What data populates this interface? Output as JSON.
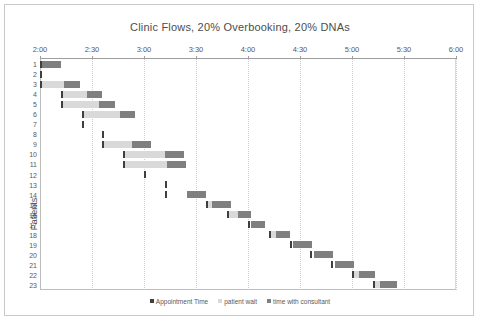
{
  "chart_data": {
    "type": "bar",
    "subtype": "horizontal-stacked-gantt",
    "title": "Clinic Flows, 20% Overbooking, 20% DNAs",
    "xlabel": "",
    "ylabel": "Patients",
    "xlim": [
      "2:00",
      "6:00"
    ],
    "x_tick_labels": [
      "2:00",
      "2:30",
      "3:00",
      "3:30",
      "4:00",
      "4:30",
      "5:00",
      "5:30",
      "6:00"
    ],
    "x_tick_minutes": [
      0,
      30,
      60,
      90,
      120,
      150,
      180,
      210,
      240
    ],
    "categories": [
      "1",
      "2",
      "3",
      "4",
      "5",
      "6",
      "7",
      "8",
      "9",
      "10",
      "11",
      "12",
      "13",
      "14",
      "15",
      "16",
      "17",
      "18",
      "19",
      "20",
      "21",
      "22",
      "23"
    ],
    "grid": "vertical-dotted",
    "legend_position": "bottom",
    "series": [
      {
        "name": "Appointment Time",
        "color": "#3f3f3f",
        "values": [
          0,
          0,
          0,
          12,
          12,
          24,
          24,
          36,
          36,
          48,
          48,
          60,
          72,
          72,
          84,
          96,
          108,
          120,
          132,
          144,
          156,
          168,
          180
        ]
      },
      {
        "name": "patient wait",
        "color": "#d9d9d9",
        "values": [
          0,
          0,
          13,
          14,
          21,
          21,
          0,
          0,
          16,
          23,
          24,
          0,
          0,
          0,
          2,
          3,
          0,
          3,
          0,
          0,
          0,
          2,
          2
        ]
      },
      {
        "name": "time with consultant",
        "color": "#7f7f7f",
        "values": [
          11,
          0,
          8,
          9,
          9,
          9,
          0,
          0,
          11,
          11,
          11,
          0,
          0,
          11,
          11,
          9,
          9,
          9,
          11,
          11,
          11,
          9,
          10
        ]
      }
    ],
    "bar_offsets_minutes": [
      0,
      0,
      0,
      12,
      12,
      24,
      24,
      36,
      36,
      48,
      48,
      60,
      72,
      72,
      84,
      96,
      108,
      120,
      132,
      144,
      156,
      168,
      180
    ],
    "rows": [
      {
        "patient": "1",
        "appt": 0,
        "wait_start": 0,
        "wait": 0,
        "cons_start": 1,
        "cons": 11
      },
      {
        "patient": "2",
        "appt": 0,
        "wait_start": 0,
        "wait": 0,
        "cons_start": 0,
        "cons": 0
      },
      {
        "patient": "3",
        "appt": 0,
        "wait_start": 1,
        "wait": 13,
        "cons_start": 14,
        "cons": 9
      },
      {
        "patient": "4",
        "appt": 12,
        "wait_start": 13,
        "wait": 14,
        "cons_start": 27,
        "cons": 9
      },
      {
        "patient": "5",
        "appt": 12,
        "wait_start": 13,
        "wait": 21,
        "cons_start": 34,
        "cons": 9
      },
      {
        "patient": "6",
        "appt": 24,
        "wait_start": 25,
        "wait": 21,
        "cons_start": 46,
        "cons": 9
      },
      {
        "patient": "7",
        "appt": 24,
        "wait_start": 0,
        "wait": 0,
        "cons_start": 0,
        "cons": 0
      },
      {
        "patient": "8",
        "appt": 36,
        "wait_start": 0,
        "wait": 0,
        "cons_start": 0,
        "cons": 0
      },
      {
        "patient": "9",
        "appt": 36,
        "wait_start": 37,
        "wait": 16,
        "cons_start": 53,
        "cons": 11
      },
      {
        "patient": "10",
        "appt": 48,
        "wait_start": 49,
        "wait": 23,
        "cons_start": 72,
        "cons": 11
      },
      {
        "patient": "11",
        "appt": 48,
        "wait_start": 49,
        "wait": 24,
        "cons_start": 73,
        "cons": 11
      },
      {
        "patient": "12",
        "appt": 60,
        "wait_start": 0,
        "wait": 0,
        "cons_start": 0,
        "cons": 0
      },
      {
        "patient": "13",
        "appt": 72,
        "wait_start": 0,
        "wait": 0,
        "cons_start": 0,
        "cons": 0
      },
      {
        "patient": "14",
        "appt": 72,
        "wait_start": 0,
        "wait": 0,
        "cons_start": 85,
        "cons": 11
      },
      {
        "patient": "15",
        "appt": 96,
        "wait_start": 97,
        "wait": 2,
        "cons_start": 99,
        "cons": 11
      },
      {
        "patient": "16",
        "appt": 108,
        "wait_start": 109,
        "wait": 5,
        "cons_start": 114,
        "cons": 8
      },
      {
        "patient": "17",
        "appt": 120,
        "wait_start": 0,
        "wait": 0,
        "cons_start": 122,
        "cons": 8
      },
      {
        "patient": "18",
        "appt": 132,
        "wait_start": 133,
        "wait": 3,
        "cons_start": 136,
        "cons": 8
      },
      {
        "patient": "19",
        "appt": 144,
        "wait_start": 0,
        "wait": 0,
        "cons_start": 146,
        "cons": 11
      },
      {
        "patient": "20",
        "appt": 156,
        "wait_start": 0,
        "wait": 0,
        "cons_start": 158,
        "cons": 11
      },
      {
        "patient": "21",
        "appt": 168,
        "wait_start": 0,
        "wait": 0,
        "cons_start": 170,
        "cons": 11
      },
      {
        "patient": "22",
        "appt": 180,
        "wait_start": 181,
        "wait": 3,
        "cons_start": 184,
        "cons": 9
      },
      {
        "patient": "23",
        "appt": 192,
        "wait_start": 193,
        "wait": 3,
        "cons_start": 196,
        "cons": 10
      }
    ],
    "legend": [
      {
        "label": "Appointment Time",
        "color": "#3f3f3f"
      },
      {
        "label": "patient wait",
        "color": "#d9d9d9"
      },
      {
        "label": "time with consultant",
        "color": "#7f7f7f"
      }
    ]
  }
}
